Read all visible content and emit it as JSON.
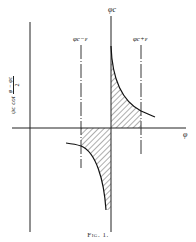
{
  "figure": {
    "caption": "Fig. 1.",
    "y_axis_label": {
      "prefix": "ψc cot",
      "fraction_numerator": "φ − φc",
      "fraction_denominator": "2"
    },
    "x_axis_label": "φ",
    "vertical_markers": [
      {
        "label": "φc",
        "style": "solid"
      },
      {
        "label": "φc−ε",
        "style": "dash-dot"
      },
      {
        "label": "φc+ε",
        "style": "dash-dot"
      }
    ],
    "shaded_regions": [
      {
        "name": "upper",
        "from": "φc",
        "to": "φc+ε",
        "pattern": "diagonal hatch"
      },
      {
        "name": "lower",
        "from": "φc−ε",
        "to": "φc",
        "pattern": "diagonal hatch"
      }
    ],
    "colors": {
      "ink": "#222222",
      "background": "#ffffff"
    }
  }
}
